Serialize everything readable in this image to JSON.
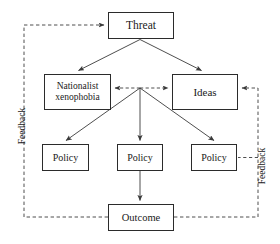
{
  "diagram": {
    "colors": {
      "box_stroke": "#2b2b2b",
      "solid_arrow": "#3a3a3a",
      "dashed_arrow": "#4a4a4a",
      "text": "#1a1a1a",
      "background": "#ffffff"
    },
    "nodes": {
      "threat": {
        "label": "Threat",
        "x": 108,
        "y": 12,
        "w": 66,
        "h": 27,
        "font_size": 11.5
      },
      "nationalist": {
        "label": "Nationalist\nxenophobia",
        "x": 44,
        "y": 74,
        "w": 67,
        "h": 36,
        "font_size": 9.5
      },
      "ideas": {
        "label": "Ideas",
        "x": 172,
        "y": 74,
        "w": 66,
        "h": 36,
        "font_size": 11
      },
      "policy_left": {
        "label": "Policy",
        "x": 42,
        "y": 144,
        "w": 47,
        "h": 27,
        "font_size": 10
      },
      "policy_center": {
        "label": "Policy",
        "x": 117,
        "y": 144,
        "w": 46,
        "h": 27,
        "font_size": 10
      },
      "policy_right": {
        "label": "Policy",
        "x": 191,
        "y": 144,
        "w": 46,
        "h": 27,
        "font_size": 10
      },
      "outcome": {
        "label": "Outcome",
        "x": 108,
        "y": 204,
        "w": 66,
        "h": 27,
        "font_size": 10.5
      }
    },
    "feedback_left": {
      "label": "Feedback",
      "center_x": 22,
      "center_y": 128,
      "font_size": 9.5
    },
    "feedback_right": {
      "label": "Feedback",
      "center_x": 262,
      "center_y": 168,
      "font_size": 9.5
    },
    "edges": [
      {
        "name": "threat-to-nationalist",
        "style": "solid",
        "from": "threat",
        "to": "nationalist",
        "arrow": "single"
      },
      {
        "name": "threat-to-ideas",
        "style": "solid",
        "from": "threat",
        "to": "ideas",
        "arrow": "single"
      },
      {
        "name": "nationalist-ideas-link",
        "style": "dashed",
        "from": "nationalist",
        "to": "ideas",
        "arrow": "double"
      },
      {
        "name": "hub-to-policy-left",
        "style": "solid",
        "from": "hub",
        "to": "policy_left",
        "arrow": "single"
      },
      {
        "name": "hub-to-policy-center",
        "style": "solid",
        "from": "hub",
        "to": "policy_center",
        "arrow": "single"
      },
      {
        "name": "hub-to-policy-right",
        "style": "solid",
        "from": "hub",
        "to": "policy_right",
        "arrow": "single"
      },
      {
        "name": "policy-center-to-outcome",
        "style": "solid",
        "from": "policy_center",
        "to": "outcome",
        "arrow": "single"
      },
      {
        "name": "outcome-feedback-to-threat",
        "style": "dashed",
        "from": "outcome",
        "to": "threat",
        "arrow": "single"
      },
      {
        "name": "outcome-feedback-to-ideas",
        "style": "dashed",
        "from": "outcome",
        "to": "ideas",
        "arrow": "single"
      },
      {
        "name": "feedback-right-to-policy-right",
        "style": "dashed",
        "from": "feedback_right_line",
        "to": "policy_right",
        "arrow": "none"
      }
    ]
  }
}
